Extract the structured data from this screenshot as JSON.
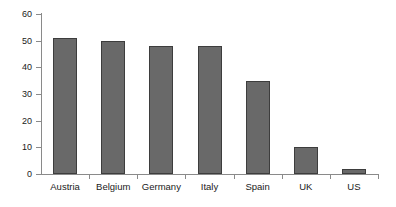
{
  "chart_data": {
    "type": "bar",
    "title": "",
    "subtitle": "",
    "xlabel": "",
    "ylabel": "",
    "categories": [
      "Austria",
      "Belgium",
      "Germany",
      "Italy",
      "Spain",
      "UK",
      "US"
    ],
    "values": [
      51,
      50,
      48,
      48,
      34.8,
      10,
      2
    ],
    "ylim": [
      0,
      60
    ],
    "yticks": [
      0,
      10,
      20,
      30,
      40,
      50,
      60
    ],
    "ytick_labels": [
      "0",
      "10",
      "20",
      "30",
      "40",
      "50",
      "60"
    ],
    "grid": false,
    "legend": false,
    "legend_position": "none",
    "annotations": [],
    "colors": {
      "bar_fill": "#696969",
      "bar_border": "#3d3d3d",
      "axis": "#8a8a8a",
      "text": "#1a1a1a",
      "background": "#ffffff"
    }
  }
}
